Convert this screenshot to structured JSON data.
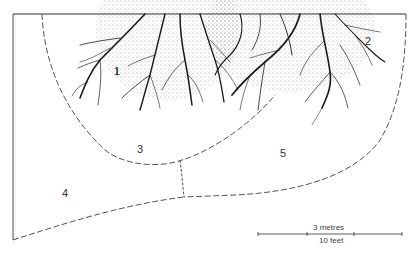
{
  "diagram": {
    "type": "garden planting zones under tree canopy with root spread",
    "zones": [
      {
        "id": "1",
        "label": "1",
        "x": 117,
        "y": 68
      },
      {
        "id": "2",
        "label": "2",
        "x": 365,
        "y": 38
      },
      {
        "id": "3",
        "label": "3",
        "x": 138,
        "y": 146
      },
      {
        "id": "4",
        "label": "4",
        "x": 63,
        "y": 190
      },
      {
        "id": "5",
        "label": "5",
        "x": 280,
        "y": 150
      }
    ],
    "scale_bar": {
      "metric_label": "3 metres",
      "imperial_label": "10 feet"
    },
    "colors": {
      "ink": "#1a1a1a",
      "stipple": "#9a9a9a",
      "dashed_boundary": "#555555",
      "background": "#ffffff"
    }
  }
}
